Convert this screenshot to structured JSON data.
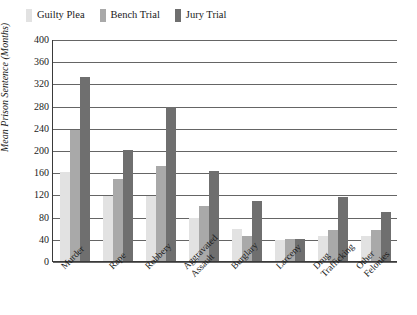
{
  "chart_data": {
    "type": "bar",
    "title": "",
    "xlabel": "",
    "ylabel": "Mean Prison Sentence (Months)",
    "ylim": [
      0,
      400
    ],
    "yticks": [
      0,
      40,
      80,
      120,
      160,
      200,
      240,
      280,
      320,
      360,
      400
    ],
    "grid": true,
    "legend_position": "top-left",
    "categories": [
      "Murder",
      "Rape",
      "Robbery",
      "Aggravated\nAssault",
      "Burglary",
      "Larceny",
      "Drug\nTrafficking",
      "Other Felonies"
    ],
    "series": [
      {
        "name": "Guilty Plea",
        "color": "#e2e2e2",
        "values": [
          160,
          118,
          118,
          78,
          57,
          38,
          45,
          45
        ]
      },
      {
        "name": "Bench Trial",
        "color": "#a9a9a9",
        "values": [
          236,
          148,
          172,
          100,
          45,
          39,
          56,
          56
        ]
      },
      {
        "name": "Jury Trial",
        "color": "#6f6f6f",
        "values": [
          332,
          200,
          277,
          163,
          108,
          40,
          115,
          88
        ]
      }
    ]
  },
  "axis": {
    "y_title": "Mean Prison Sentence (Months)"
  }
}
